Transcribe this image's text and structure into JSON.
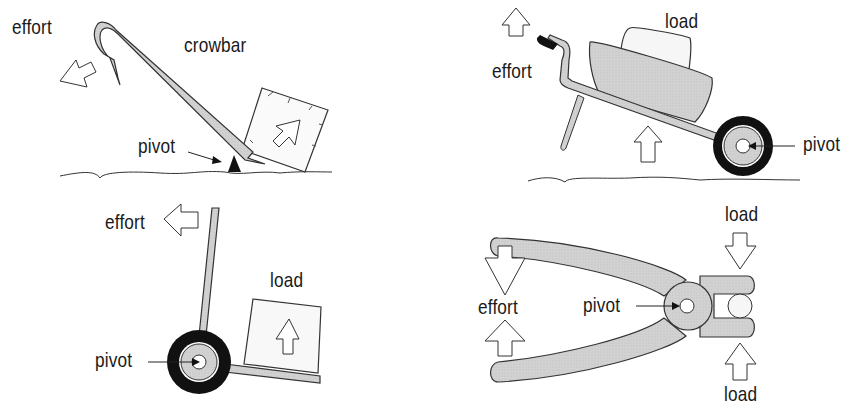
{
  "diagram": {
    "panels": [
      {
        "id": "crowbar",
        "labels": {
          "effort": "effort",
          "tool": "crowbar",
          "pivot": "pivot"
        }
      },
      {
        "id": "wheelbarrow",
        "labels": {
          "effort": "effort",
          "load": "load",
          "pivot": "pivot"
        }
      },
      {
        "id": "hand-truck",
        "labels": {
          "effort": "effort",
          "load": "load",
          "pivot": "pivot"
        }
      },
      {
        "id": "pliers",
        "labels": {
          "effort": "effort",
          "load_top": "load",
          "load_bottom": "load",
          "pivot": "pivot"
        }
      }
    ],
    "colors": {
      "fill_grey": "#d4d4d4",
      "outline": "#222222",
      "tyre": "#111111",
      "background": "#ffffff"
    }
  }
}
